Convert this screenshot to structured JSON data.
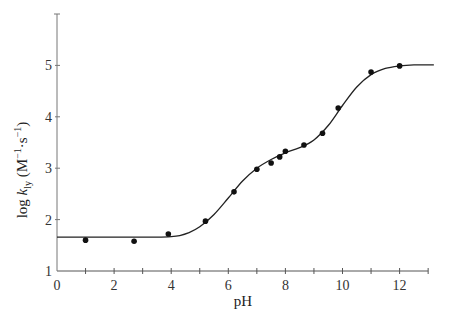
{
  "chart_data": {
    "type": "scatter",
    "title": "",
    "xlabel": "pH",
    "ylabel": "log k_ly (M^-1·s^-1)",
    "ylabel_parts": {
      "pre": "log ",
      "k": "k",
      "sub": "ly",
      "units_open": " (M",
      "sup1": "−1",
      "mid": "·s",
      "sup2": "−1",
      "units_close": ")"
    },
    "xlim": [
      0,
      13
    ],
    "ylim": [
      1,
      6
    ],
    "x_ticks": [
      0,
      2,
      4,
      6,
      8,
      10,
      12
    ],
    "x_minor_ticks": [
      1,
      3,
      5,
      7,
      9,
      11,
      13
    ],
    "y_ticks": [
      1,
      2,
      3,
      4,
      5
    ],
    "grid": false,
    "legend": null,
    "series": [
      {
        "name": "experimental points",
        "kind": "scatter",
        "x": [
          1.0,
          2.7,
          3.9,
          5.2,
          6.2,
          7.0,
          7.5,
          7.8,
          8.0,
          8.65,
          9.3,
          9.85,
          11.0,
          12.0
        ],
        "y": [
          1.6,
          1.58,
          1.72,
          1.97,
          2.54,
          2.98,
          3.1,
          3.22,
          3.33,
          3.45,
          3.68,
          4.17,
          4.87,
          4.99
        ]
      },
      {
        "name": "fitted curve",
        "kind": "line",
        "x": [
          0,
          1,
          2,
          3,
          3.5,
          4.0,
          4.3,
          4.6,
          5.0,
          5.5,
          6.0,
          6.5,
          7.0,
          7.5,
          8.0,
          8.5,
          9.0,
          9.5,
          10.0,
          10.5,
          11.0,
          11.5,
          12.0,
          12.5,
          13.2
        ],
        "y": [
          1.66,
          1.66,
          1.66,
          1.66,
          1.66,
          1.67,
          1.69,
          1.74,
          1.86,
          2.1,
          2.42,
          2.75,
          3.0,
          3.17,
          3.3,
          3.4,
          3.55,
          3.83,
          4.22,
          4.58,
          4.82,
          4.94,
          4.99,
          5.01,
          5.01
        ]
      }
    ]
  }
}
